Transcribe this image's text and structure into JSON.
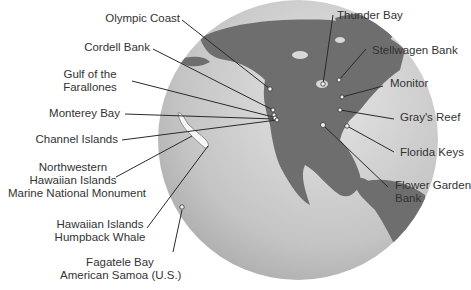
{
  "map": {
    "globe_color": "#c8c8c8",
    "land_color": "#6e6e6e",
    "line_color": "#2a2a2a"
  },
  "labels": {
    "olympic_coast": "Olympic Coast",
    "cordell_bank": "Cordell Bank",
    "gulf_farallones_1": "Gulf of the",
    "gulf_farallones_2": "Farallones",
    "monterey_bay": "Monterey Bay",
    "channel_islands": "Channel Islands",
    "nw_hawaiian_1": "Northwestern",
    "nw_hawaiian_2": "Hawaiian Islands",
    "nw_hawaiian_3": "Marine National Monument",
    "hawaiian_whale_1": "Hawaiian Islands",
    "hawaiian_whale_2": "Humpback Whale",
    "fagatele_1": "Fagatele Bay",
    "fagatele_2": "American Samoa (U.S.)",
    "thunder_bay": "Thunder Bay",
    "stellwagen_bank": "Stellwagen Bank",
    "monitor": "Monitor",
    "grays_reef": "Gray's Reef",
    "florida_keys": "Florida Keys",
    "flower_garden_1": "Flower Garden",
    "flower_garden_2": "Bank"
  }
}
